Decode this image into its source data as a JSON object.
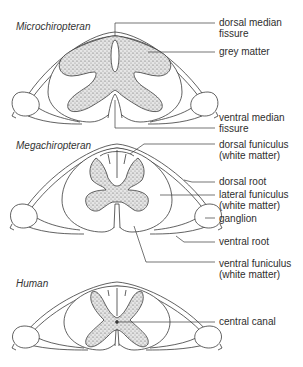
{
  "figure": {
    "panels": [
      {
        "id": "microchiropteran",
        "title": "Microchiropteran",
        "labels": [
          {
            "line1": "dorsal median",
            "line2": "fissure"
          },
          {
            "line1": "grey matter",
            "line2": ""
          },
          {
            "line1": "ventral median",
            "line2": "fissure"
          }
        ]
      },
      {
        "id": "megachiropteran",
        "title": "Megachiropteran",
        "labels": [
          {
            "line1": "dorsal funiculus",
            "line2": "(white matter)"
          },
          {
            "line1": "dorsal root",
            "line2": ""
          },
          {
            "line1": "lateral funiculus",
            "line2": "(white matter)"
          },
          {
            "line1": "ganglion",
            "line2": ""
          },
          {
            "line1": "ventral root",
            "line2": ""
          },
          {
            "line1": "ventral funiculus",
            "line2": "(white matter)"
          }
        ]
      },
      {
        "id": "human",
        "title": "Human",
        "labels": [
          {
            "line1": "central canal",
            "line2": ""
          }
        ]
      }
    ],
    "colors": {
      "stroke": "#3a3a3a",
      "grey_matter_fill": "#d9d9d9",
      "background": "#ffffff"
    }
  }
}
